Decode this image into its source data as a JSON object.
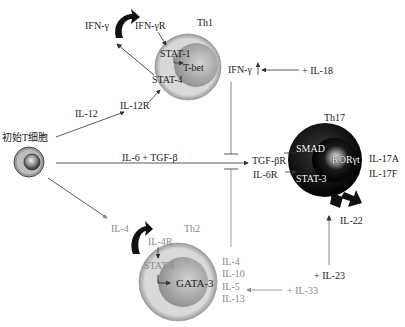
{
  "naive_cell": {
    "label": "初始T细胞"
  },
  "th1": {
    "title": "Th1",
    "ifn_gamma": "IFN-γ",
    "ifn_gamma_r": "IFN-γR",
    "stat1": "STAT-1",
    "tbet": "T-bet",
    "stat4": "STAT-4",
    "il12r": "IL-12R",
    "il12": "IL-12",
    "ifn_gamma_up": "IFN-γ",
    "il18": "+ IL-18"
  },
  "th17": {
    "title": "Th17",
    "inducer": "IL-6 + TGF-β",
    "tgf_beta_r": "TGF-βR",
    "il6r": "IL-6R",
    "smad": "SMAD",
    "stat3": "STAT-3",
    "ror_gamma_t": "RORγt",
    "il17a": "IL-17A",
    "il17f": "IL-17F",
    "il22": "IL-22",
    "il23": "+ IL-23"
  },
  "th2": {
    "title": "Th2",
    "il4_in": "IL-4",
    "il4r": "IL-4R",
    "stat6": "STAT-6",
    "gata3": "GATA-3",
    "outputs": [
      "IL-4",
      "IL-10",
      "IL-5",
      "IL-13"
    ],
    "il33": "+ IL-33"
  },
  "colors": {
    "th1_outer": "#d9d9d9",
    "th1_inner": "#a8a8a8",
    "th17_body": "#111111",
    "th2_outer": "#dcdcdc",
    "th2_inner": "#a5a5a5",
    "line_dark": "#333333",
    "line_gray": "#8a8a8a"
  }
}
